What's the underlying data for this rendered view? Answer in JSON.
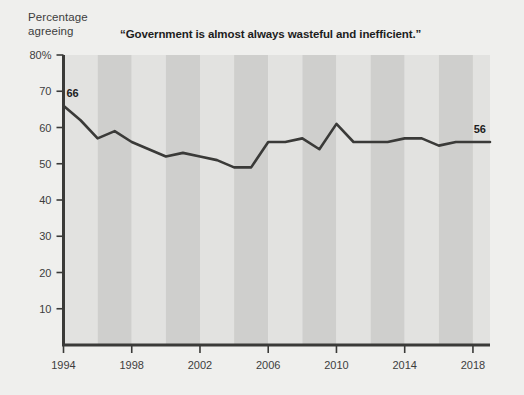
{
  "figure": {
    "axis_caption": "Percentage\nagreeing",
    "background_color": "#efefed",
    "band_light_color": "#e2e2e0",
    "band_dark_color": "#cfcfcd",
    "axis_color": "#3a3a38",
    "line_color": "#3a3a38",
    "text_color": "#3d3d3d"
  },
  "chart_data": {
    "type": "line",
    "title": "“Government is almost always wasteful and inefficient.”",
    "xlabel": "",
    "ylabel": "Percentage agreeing",
    "xlim": [
      1994,
      2019
    ],
    "ylim": [
      0,
      80
    ],
    "grid": false,
    "legend": "none",
    "band_shading": "alternating vertical bands every 2 years",
    "yticks": [
      10,
      20,
      30,
      40,
      50,
      60,
      70,
      80
    ],
    "ytick_labels": [
      "10",
      "20",
      "30",
      "40",
      "50",
      "60",
      "70",
      "80%"
    ],
    "xticks": [
      1994,
      1998,
      2002,
      2006,
      2010,
      2014,
      2018
    ],
    "xtick_labels": [
      "1994",
      "1998",
      "2002",
      "2006",
      "2010",
      "2014",
      "2018"
    ],
    "series": [
      {
        "name": "Percentage agreeing",
        "x": [
          1994,
          1995,
          1996,
          1997,
          1998,
          1999,
          2000,
          2001,
          2002,
          2003,
          2004,
          2005,
          2006,
          2007,
          2008,
          2009,
          2010,
          2011,
          2012,
          2013,
          2014,
          2015,
          2016,
          2017,
          2018,
          2019
        ],
        "values": [
          66,
          62,
          57,
          59,
          56,
          54,
          52,
          53,
          52,
          51,
          49,
          49,
          56,
          56,
          57,
          54,
          61,
          56,
          56,
          56,
          57,
          57,
          55,
          56,
          56,
          56
        ]
      }
    ],
    "annotations": [
      {
        "label": "66",
        "x": 1994,
        "y": 66,
        "position": "above-right"
      },
      {
        "label": "56",
        "x": 2019,
        "y": 56,
        "position": "above-left"
      }
    ]
  }
}
